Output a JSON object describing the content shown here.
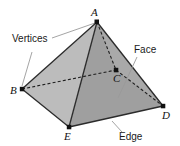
{
  "figure": {
    "background_color": "#ffffff",
    "face_left_color": "#b9b9b9",
    "face_right_color": "#9d9d9d",
    "edge_color": "#2b2b2b",
    "hidden_edge_style": "dashed",
    "leader_color": "#9a9a9a"
  },
  "annotations": {
    "vertices_label": "Vertices",
    "face_label": "Face",
    "edge_label": "Edge"
  },
  "vertices": [
    {
      "name": "A",
      "label": "A",
      "x": 97,
      "y": 22,
      "hidden": false
    },
    {
      "name": "B",
      "label": "B",
      "x": 22,
      "y": 89,
      "hidden": false
    },
    {
      "name": "C",
      "label": "C",
      "x": 116,
      "y": 70,
      "hidden": true
    },
    {
      "name": "D",
      "label": "D",
      "x": 163,
      "y": 106,
      "hidden": false
    },
    {
      "name": "E",
      "label": "E",
      "x": 69,
      "y": 127,
      "hidden": false
    }
  ],
  "edges": [
    {
      "from": "A",
      "to": "B",
      "hidden": false
    },
    {
      "from": "A",
      "to": "E",
      "hidden": false
    },
    {
      "from": "A",
      "to": "D",
      "hidden": false
    },
    {
      "from": "B",
      "to": "E",
      "hidden": false
    },
    {
      "from": "E",
      "to": "D",
      "hidden": false
    },
    {
      "from": "A",
      "to": "C",
      "hidden": true
    },
    {
      "from": "B",
      "to": "C",
      "hidden": true
    },
    {
      "from": "C",
      "to": "D",
      "hidden": true
    }
  ],
  "faces": [
    {
      "name": "left-face",
      "vertices": [
        "A",
        "B",
        "E"
      ],
      "color": "#b9b9b9"
    },
    {
      "name": "right-face",
      "vertices": [
        "A",
        "E",
        "D"
      ],
      "color": "#9d9d9d"
    }
  ]
}
